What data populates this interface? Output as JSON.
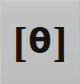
{
  "tile": {
    "name": "ipa-theta-button",
    "symbol_full": "[θ]",
    "bracket_left": "[",
    "phonetic_symbol": "θ",
    "bracket_right": "]",
    "background_color": "#c0c0c0",
    "glyph_color": "#141414",
    "highlight_color": "#cfcfcf",
    "shadow_color": "#bababa"
  }
}
